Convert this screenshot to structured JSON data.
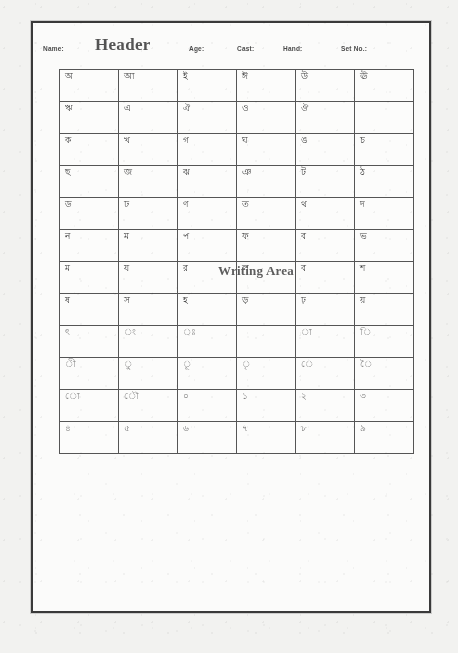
{
  "document": {
    "kind": "bengali-handwriting-data-collection-form",
    "title": "Header",
    "writing_area_label": "Writing Area"
  },
  "header": {
    "fields": [
      {
        "label": "Name:",
        "value": ""
      },
      {
        "label": "Age:",
        "value": ""
      },
      {
        "label": "Cast:",
        "value": ""
      },
      {
        "label": "Hand:",
        "value": ""
      },
      {
        "label": "Set No.:",
        "value": ""
      }
    ]
  },
  "grid": {
    "columns": 6,
    "rows": 12,
    "cells": [
      [
        "অ",
        "আ",
        "ই",
        "ঈ",
        "উ",
        "ঊ"
      ],
      [
        "ঋ",
        "এ",
        "ঐ",
        "ও",
        "ঔ",
        ""
      ],
      [
        "ক",
        "খ",
        "গ",
        "ঘ",
        "ঙ",
        "চ"
      ],
      [
        "ছ",
        "জ",
        "ঝ",
        "ঞ",
        "ট",
        "ঠ"
      ],
      [
        "ড",
        "ঢ",
        "ণ",
        "ত",
        "থ",
        "দ"
      ],
      [
        "ন",
        "ম",
        "প",
        "ফ",
        "ব",
        "ভ"
      ],
      [
        "ম",
        "য",
        "র",
        "ল",
        "ব",
        "শ"
      ],
      [
        "ষ",
        "স",
        "হ",
        "ড়",
        "ঢ়",
        "য়"
      ],
      [
        "ৎ",
        "ং",
        "ঃ",
        "",
        "া",
        "ি"
      ],
      [
        "ী",
        "ু",
        "ূ",
        "ৃ",
        "ে",
        "ৈ"
      ],
      [
        "ো",
        "ৌ",
        "০",
        "১",
        "২",
        "৩"
      ],
      [
        "৪",
        "৫",
        "৬",
        "৭",
        "৮",
        "৯"
      ]
    ]
  },
  "colors": {
    "page_background": "#f2f2f0",
    "sheet_background": "#fbfbfa",
    "frame_stroke": "#3a3a3a",
    "grid_stroke": "#555555",
    "ink": "#3c3c3c",
    "title_ink": "#545454"
  }
}
